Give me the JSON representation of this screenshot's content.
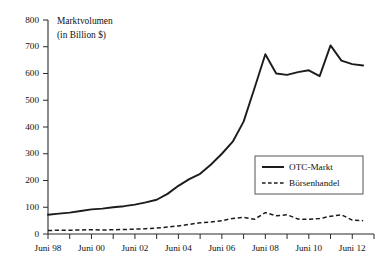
{
  "chart_data": {
    "type": "line",
    "title": "",
    "axis_title_line1": "Marktvolumen",
    "axis_title_line2": "(in Billion $)",
    "xlabel": "",
    "ylabel": "Marktvolumen (in Billion $)",
    "ylim": [
      0,
      800
    ],
    "ytick_values": [
      0,
      100,
      200,
      300,
      400,
      500,
      600,
      700,
      800
    ],
    "ytick_labels": [
      "0",
      "100",
      "200",
      "300",
      "400",
      "500",
      "600",
      "700",
      "800"
    ],
    "grid": false,
    "legend_position": "center-right",
    "x": [
      1998,
      1999,
      2000,
      2001,
      2002,
      2003,
      2004,
      2005,
      2006,
      2007,
      2008,
      2009,
      2010,
      2011,
      2012
    ],
    "xlim": [
      1998,
      2013
    ],
    "xtick_values": [
      1998,
      1999,
      2000,
      2001,
      2002,
      2003,
      2004,
      2005,
      2006,
      2007,
      2008,
      2009,
      2010,
      2011,
      2012,
      2013
    ],
    "xtick_labels": [
      "Juni 98",
      "Juni 00",
      "Juni 02",
      "Juni 04",
      "Juni 06",
      "Juni 08",
      "Juni 10",
      "Juni 12"
    ],
    "xtick_labeled_values": [
      1998,
      2000,
      2002,
      2004,
      2006,
      2008,
      2010,
      2012
    ],
    "series": [
      {
        "name": "OTC-Markt",
        "style": "solid",
        "color": "#1c1c1c",
        "x": [
          1998,
          1998.5,
          1999,
          1999.5,
          2000,
          2000.5,
          2001,
          2001.5,
          2002,
          2002.5,
          2003,
          2003.5,
          2004,
          2004.5,
          2005,
          2005.5,
          2006,
          2006.5,
          2007,
          2007.5,
          2008,
          2008.5,
          2009,
          2009.5,
          2010,
          2010.5,
          2011,
          2011.5,
          2012,
          2012.5
        ],
        "values": [
          72,
          76,
          80,
          86,
          92,
          95,
          100,
          104,
          110,
          118,
          128,
          150,
          180,
          205,
          225,
          260,
          300,
          345,
          420,
          545,
          672,
          600,
          595,
          605,
          612,
          590,
          705,
          648,
          635,
          630
        ]
      },
      {
        "name": "Börsenhandel",
        "style": "dashed",
        "color": "#1c1c1c",
        "x": [
          1998,
          1998.5,
          1999,
          1999.5,
          2000,
          2000.5,
          2001,
          2001.5,
          2002,
          2002.5,
          2003,
          2003.5,
          2004,
          2004.5,
          2005,
          2005.5,
          2006,
          2006.5,
          2007,
          2007.5,
          2008,
          2008.5,
          2009,
          2009.5,
          2010,
          2010.5,
          2011,
          2011.5,
          2012,
          2012.5
        ],
        "values": [
          13,
          14,
          14,
          15,
          16,
          15,
          16,
          17,
          18,
          20,
          22,
          26,
          30,
          36,
          42,
          45,
          50,
          58,
          62,
          55,
          80,
          68,
          72,
          56,
          55,
          58,
          66,
          72,
          52,
          50
        ]
      }
    ]
  },
  "legend": {
    "items": [
      {
        "label": "OTC-Markt",
        "style": "solid"
      },
      {
        "label": "Börsenhandel",
        "style": "dashed"
      }
    ]
  }
}
